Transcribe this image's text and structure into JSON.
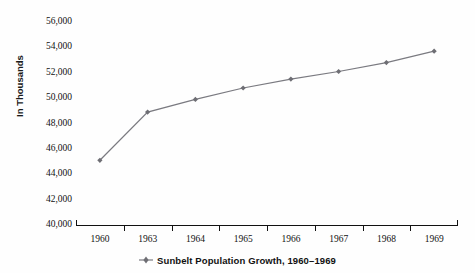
{
  "chart_data": {
    "type": "line",
    "title": "",
    "xlabel": "",
    "ylabel": "In Thousands",
    "categories": [
      "1960",
      "1963",
      "1964",
      "1965",
      "1966",
      "1967",
      "1968",
      "1969"
    ],
    "series": [
      {
        "name": "Sunbelt Population Growth, 1960–1969",
        "values": [
          45100,
          48900,
          49900,
          50800,
          51500,
          52100,
          52800,
          53700
        ]
      }
    ],
    "ylim": [
      40000,
      56000
    ],
    "ytick_values": [
      40000,
      42000,
      44000,
      46000,
      48000,
      50000,
      52000,
      54000,
      56000
    ],
    "ytick_labels": [
      "40,000",
      "42,000",
      "44,000",
      "46,000",
      "48,000",
      "50,000",
      "52,000",
      "54,000",
      "56,000"
    ],
    "grid": false,
    "legend_position": "bottom",
    "line_color": "#7a7a80",
    "marker_color": "#6e6e74",
    "marker_shape": "diamond",
    "axis_color": "#111111",
    "background_color": "#fefefe"
  },
  "legend": {
    "entries": [
      {
        "label": "Sunbelt Population Growth, 1960–1969",
        "color": "#7a7a80"
      }
    ]
  },
  "axes": {
    "y_title": "In Thousands"
  }
}
